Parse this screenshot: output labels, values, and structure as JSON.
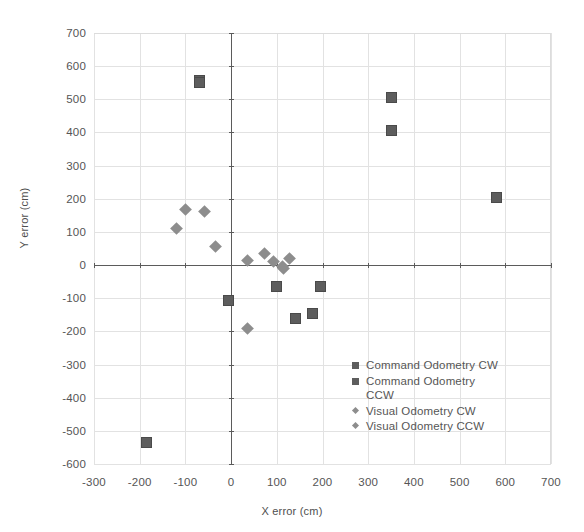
{
  "chart_data": {
    "type": "scatter",
    "title": "",
    "xlabel": "X error (cm)",
    "ylabel": "Y error (cm)",
    "xlim": [
      -300,
      700
    ],
    "ylim": [
      -600,
      700
    ],
    "xticks": [
      -300,
      -200,
      -100,
      0,
      100,
      200,
      300,
      400,
      500,
      600,
      700
    ],
    "yticks": [
      700,
      600,
      500,
      400,
      300,
      200,
      100,
      0,
      -100,
      -200,
      -300,
      -400,
      -500,
      -600
    ],
    "xtick_labels": [
      "-300",
      "-200",
      "-100",
      "0",
      "100",
      "200",
      "300",
      "400",
      "500",
      "600",
      "700"
    ],
    "ytick_labels": [
      "700",
      "600",
      "500",
      "400",
      "300",
      "200",
      "100",
      "0",
      "-100",
      "-200",
      "-300",
      "-400",
      "-500",
      "-600"
    ],
    "grid": true,
    "legend_position": "lower-right inside",
    "series": [
      {
        "name": "Command Odometry CW",
        "marker": "square",
        "color": "#5d5d5d",
        "points": [
          {
            "x": -70,
            "y": 557
          },
          {
            "x": 350,
            "y": 505
          },
          {
            "x": 580,
            "y": 205
          },
          {
            "x": 100,
            "y": -65
          },
          {
            "x": 195,
            "y": -65
          },
          {
            "x": -185,
            "y": -535
          }
        ]
      },
      {
        "name": "Command Odometry CCW",
        "marker": "square",
        "color": "#5d5d5d",
        "points": [
          {
            "x": -70,
            "y": 552
          },
          {
            "x": 352,
            "y": 405
          },
          {
            "x": -5,
            "y": -107
          },
          {
            "x": 140,
            "y": -160
          },
          {
            "x": 178,
            "y": -145
          }
        ]
      },
      {
        "name": "Visual Odometry CW",
        "marker": "diamond",
        "color": "#8d8d8d",
        "points": [
          {
            "x": -100,
            "y": 168
          },
          {
            "x": -120,
            "y": 110
          },
          {
            "x": -35,
            "y": 57
          },
          {
            "x": 35,
            "y": 15
          },
          {
            "x": 72,
            "y": 35
          },
          {
            "x": 112,
            "y": -5
          },
          {
            "x": 35,
            "y": -190
          }
        ]
      },
      {
        "name": "Visual Odometry CCW",
        "marker": "diamond",
        "color": "#8d8d8d",
        "points": [
          {
            "x": -58,
            "y": 162
          },
          {
            "x": 92,
            "y": 12
          },
          {
            "x": 128,
            "y": 20
          },
          {
            "x": 115,
            "y": -10
          }
        ]
      }
    ]
  },
  "legend": {
    "entries": [
      {
        "label": "Command Odometry CW",
        "marker": "square"
      },
      {
        "label": "Command Odometry\nCCW",
        "marker": "square"
      },
      {
        "label": "Visual Odometry CW",
        "marker": "diamond"
      },
      {
        "label": "Visual Odometry CCW",
        "marker": "diamond"
      }
    ]
  }
}
